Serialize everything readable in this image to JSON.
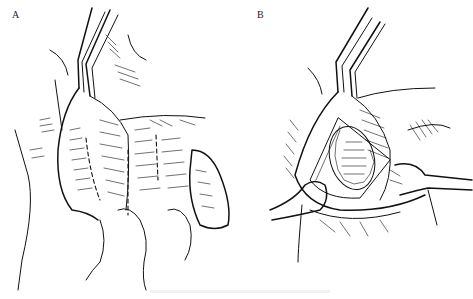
{
  "figure": {
    "panels": [
      {
        "id": "A",
        "label": "A",
        "description": "Surgical illustration: forceps retracting tissue flap with dashed incision lines"
      },
      {
        "id": "B",
        "label": "B",
        "description": "Surgical illustration: retracted opening with sutured inner layer, held by two retractors"
      }
    ],
    "colors": {
      "ink": "#111111",
      "background": "#ffffff"
    }
  }
}
